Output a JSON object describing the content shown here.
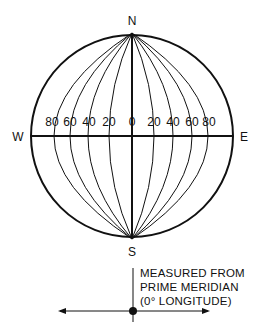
{
  "diagram": {
    "compass": {
      "north": "N",
      "south": "S",
      "west": "W",
      "east": "E"
    },
    "west_labels": [
      "80",
      "60",
      "40",
      "20"
    ],
    "center_label": "0",
    "east_labels": [
      "20",
      "40",
      "60",
      "80"
    ],
    "note_lines": [
      "MEASURED FROM",
      "PRIME MERIDIAN",
      "(0° LONGITUDE)"
    ],
    "line_color": "#111111"
  }
}
